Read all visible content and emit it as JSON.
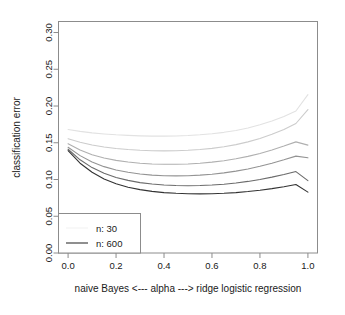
{
  "chart_data": {
    "type": "line",
    "title": "",
    "xlabel": "naive Bayes  <---  alpha  --->  ridge logistic regression",
    "ylabel": "classification error",
    "xlim": [
      -0.04,
      1.04
    ],
    "ylim": [
      0.0,
      0.315
    ],
    "grid": false,
    "legend_position": "bottom-left",
    "xticks": [
      "0.0",
      "0.2",
      "0.4",
      "0.6",
      "0.8",
      "1.0"
    ],
    "xtick_values": [
      0.0,
      0.2,
      0.4,
      0.6,
      0.8,
      1.0
    ],
    "yticks": [
      "0.00",
      "0.05",
      "0.10",
      "0.15",
      "0.20",
      "0.25",
      "0.30"
    ],
    "ytick_values": [
      0.0,
      0.05,
      0.1,
      0.15,
      0.2,
      0.25,
      0.3
    ],
    "x": [
      0.0,
      0.05,
      0.1,
      0.15,
      0.2,
      0.25,
      0.3,
      0.35,
      0.4,
      0.45,
      0.5,
      0.55,
      0.6,
      0.65,
      0.7,
      0.75,
      0.8,
      0.85,
      0.9,
      0.95,
      1.0
    ],
    "series": [
      {
        "name": "n: 30",
        "color": "#e2e2e2",
        "values": [
          0.168,
          0.1655,
          0.1635,
          0.162,
          0.1608,
          0.16,
          0.1594,
          0.159,
          0.159,
          0.1592,
          0.1598,
          0.1608,
          0.1622,
          0.1642,
          0.1668,
          0.1702,
          0.1744,
          0.1796,
          0.1858,
          0.1932,
          0.2155
        ]
      },
      {
        "name": "n: 60",
        "color": "#cccccc",
        "values": [
          0.1555,
          0.1508,
          0.147,
          0.1442,
          0.1422,
          0.1408,
          0.1398,
          0.1392,
          0.139,
          0.1392,
          0.1398,
          0.1408,
          0.1424,
          0.1446,
          0.1475,
          0.1512,
          0.1558,
          0.1615,
          0.1682,
          0.1762,
          0.1952
        ]
      },
      {
        "name": "n: 120",
        "color": "#b0b0b0",
        "values": [
          0.1488,
          0.1402,
          0.1338,
          0.1292,
          0.126,
          0.1238,
          0.1222,
          0.1212,
          0.1208,
          0.1208,
          0.1212,
          0.1222,
          0.1236,
          0.1256,
          0.1282,
          0.1315,
          0.1355,
          0.1402,
          0.1455,
          0.1512,
          0.1468
        ]
      },
      {
        "name": "n: 200",
        "color": "#949494",
        "values": [
          0.1438,
          0.1325,
          0.1238,
          0.1175,
          0.113,
          0.1098,
          0.1075,
          0.106,
          0.1052,
          0.105,
          0.1052,
          0.106,
          0.1072,
          0.109,
          0.1114,
          0.1144,
          0.118,
          0.1222,
          0.1268,
          0.1318,
          0.1295
        ]
      },
      {
        "name": "n: 350",
        "color": "#6b6b6b",
        "values": [
          0.1412,
          0.1268,
          0.1162,
          0.1085,
          0.1028,
          0.0988,
          0.0958,
          0.0938,
          0.0925,
          0.0918,
          0.0916,
          0.0918,
          0.0925,
          0.0936,
          0.0952,
          0.0974,
          0.1,
          0.1032,
          0.1068,
          0.1108,
          0.0985
        ]
      },
      {
        "name": "n: 600",
        "color": "#333333",
        "values": [
          0.1392,
          0.1222,
          0.1098,
          0.1008,
          0.0942,
          0.0895,
          0.0862,
          0.0838,
          0.0822,
          0.0812,
          0.0806,
          0.0804,
          0.0806,
          0.0812,
          0.0822,
          0.0836,
          0.0854,
          0.0876,
          0.0902,
          0.0932,
          0.0828
        ]
      }
    ],
    "legend_entries": [
      {
        "label": "n: 30",
        "color": "#f2f2f2",
        "show_line": false
      },
      {
        "label": "n: 600",
        "color": "#333333",
        "show_line": true
      }
    ]
  }
}
